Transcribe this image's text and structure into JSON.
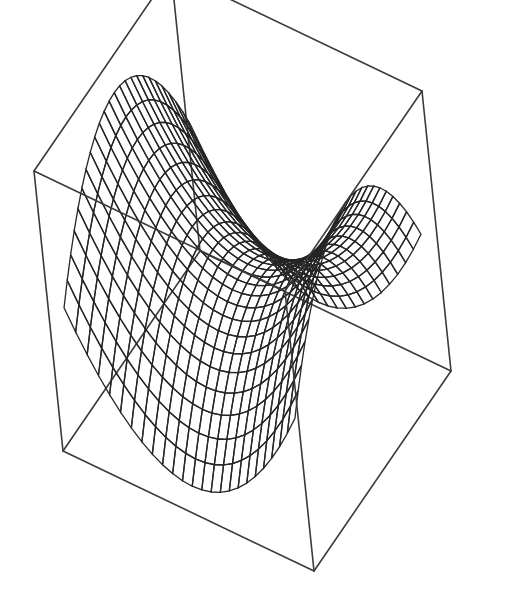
{
  "chart_data": {
    "type": "surface3d",
    "title": "",
    "xlabel": "",
    "ylabel": "",
    "zlabel": "",
    "function": "z = x^2 - y^2",
    "x_range": [
      -1,
      1
    ],
    "y_range": [
      -1,
      1
    ],
    "z_range": [
      -1,
      1
    ],
    "mesh": {
      "u_lines": 24,
      "v_lines": 24
    },
    "boxed": true,
    "axes_ticks": false,
    "shading": "grayscale",
    "colors": {
      "background": "#ffffff",
      "box": "#3a3a3a",
      "mesh": "#262626",
      "surface_light": "#c4c4c4",
      "surface_dark": "#3c3c3c"
    }
  },
  "box": {
    "corners": {
      "top_back": [
        233,
        37
      ],
      "top_left": [
        34,
        171
      ],
      "top_right": [
        493,
        107
      ],
      "bottom_left": [
        63,
        451
      ],
      "bottom_front": [
        314,
        571
      ],
      "bottom_right": [
        451,
        371
      ]
    }
  }
}
